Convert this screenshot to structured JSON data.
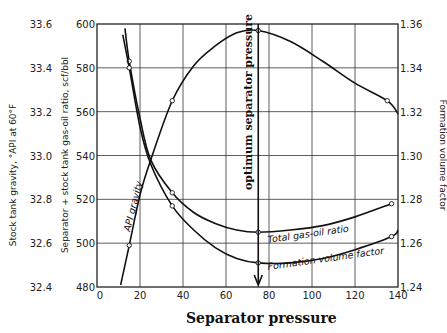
{
  "chart_data": {
    "type": "line",
    "title": "",
    "xlabel": "Separator pressure",
    "xlim": [
      0,
      140
    ],
    "x_ticks": [
      "0",
      "20",
      "40",
      "60",
      "80",
      "100",
      "120",
      "140"
    ],
    "axes": {
      "left_outer": {
        "label": "Stock tank gravity, °API at 60°F",
        "range": [
          32.4,
          33.6
        ],
        "ticks": [
          "33.6",
          "33.4",
          "33.2",
          "33.0",
          "32.8",
          "32.6",
          "32.4"
        ]
      },
      "left_inner": {
        "label": "Separator + stock tank gas-oil ratio, scf/bbl",
        "range": [
          480,
          600
        ],
        "ticks": [
          "600",
          "580",
          "560",
          "540",
          "520",
          "500",
          "480"
        ]
      },
      "right": {
        "label": "Formation volume factor",
        "range": [
          1.24,
          1.36
        ],
        "ticks": [
          "1.36",
          "1.34",
          "1.32",
          "1.30",
          "1.28",
          "1.26",
          "1.24"
        ]
      }
    },
    "grid": true,
    "series": [
      {
        "name": "API gravity",
        "axis": "left_outer",
        "x": [
          11,
          15,
          20,
          25,
          35,
          45,
          55,
          65,
          75,
          90,
          105,
          120,
          135,
          140
        ],
        "values": [
          32.41,
          32.59,
          32.82,
          32.98,
          33.25,
          33.41,
          33.5,
          33.56,
          33.57,
          33.52,
          33.43,
          33.33,
          33.25,
          33.19
        ],
        "markers_x": [
          15,
          35,
          75,
          135
        ]
      },
      {
        "name": "Total gas-oil ratio",
        "axis": "left_inner",
        "x": [
          13,
          15,
          20,
          25,
          35,
          45,
          55,
          65,
          75,
          90,
          105,
          120,
          137
        ],
        "values": [
          598,
          583,
          557,
          538,
          523,
          514,
          509,
          506,
          505,
          506,
          508,
          512,
          518
        ],
        "markers_x": [
          15,
          35,
          75,
          137
        ]
      },
      {
        "name": "Formation volume factor",
        "axis": "right",
        "x": [
          12,
          15,
          20,
          25,
          35,
          45,
          55,
          65,
          75,
          90,
          105,
          120,
          137,
          140
        ],
        "values": [
          1.355,
          1.34,
          1.313,
          1.296,
          1.277,
          1.266,
          1.258,
          1.253,
          1.251,
          1.251,
          1.253,
          1.257,
          1.263,
          1.266
        ],
        "markers_x": [
          15,
          35,
          75,
          137
        ]
      }
    ],
    "annotations": [
      {
        "text": "optimum separator pressure",
        "x": 75,
        "arrow": "down"
      },
      {
        "text": "API gravity",
        "series": "API gravity"
      },
      {
        "text": "Total gas-oil ratio",
        "series": "Total gas-oil ratio"
      },
      {
        "text": "Formation volume factor",
        "series": "Formation volume factor"
      }
    ]
  },
  "labels": {
    "xlabel": "Separator pressure",
    "left_outer_label": "Stock tank gravity, °API at 60°F",
    "left_inner_label": "Separator + stock tank gas-oil ratio, scf/bbl",
    "right_label": "Formation volume factor",
    "optimum": "optimum separator pressure",
    "api_curve": "API gravity",
    "gor_curve": "Total gas-oil ratio",
    "fvf_curve": "Formation volume factor"
  }
}
